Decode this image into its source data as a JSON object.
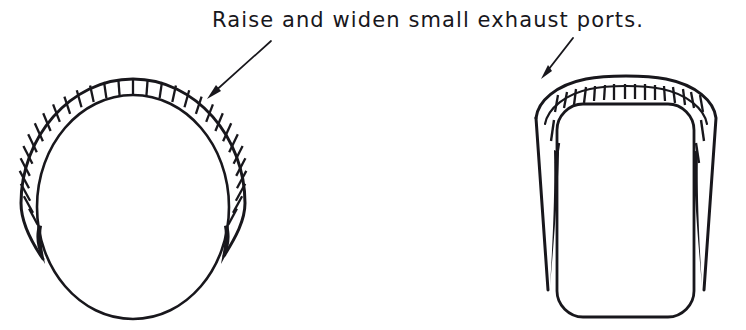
{
  "figure": {
    "background_color": "#ffffff",
    "ink_color": "#18171c",
    "type": "technical-line-drawing"
  },
  "annotation": {
    "label": "Raise and widen small exhaust ports.",
    "x": 212,
    "y": 27,
    "font_size": 21
  },
  "arrows": [
    {
      "name": "arrow-to-left-port",
      "from_x": 271,
      "from_y": 41,
      "to_x": 207,
      "to_y": 99,
      "head_length": 17,
      "head_width": 6
    },
    {
      "name": "arrow-to-right-port",
      "from_x": 573,
      "from_y": 38,
      "to_x": 541,
      "to_y": 79,
      "head_length": 16,
      "head_width": 6
    }
  ],
  "ports": [
    {
      "name": "left-port-circular",
      "caption": "original round exhaust port",
      "center_x": 133,
      "center_y": 207,
      "inner_radius_x": 96,
      "inner_radius_y": 112,
      "outer_offset": 16,
      "hatch_tick_count": 22,
      "hatch_span_degrees": 186
    },
    {
      "name": "right-port-rounded-rect",
      "caption": "modified raised and widened exhaust port",
      "rect_left": 557,
      "rect_top": 104,
      "rect_width": 137,
      "rect_height": 213,
      "corner_radius": 26,
      "outer_top_rise": 28,
      "outer_side_spread": 24,
      "hatch_tick_count": 17
    }
  ],
  "legend": {
    "hatching_meaning": "material to be removed",
    "left_label": "before",
    "right_label": "after"
  }
}
